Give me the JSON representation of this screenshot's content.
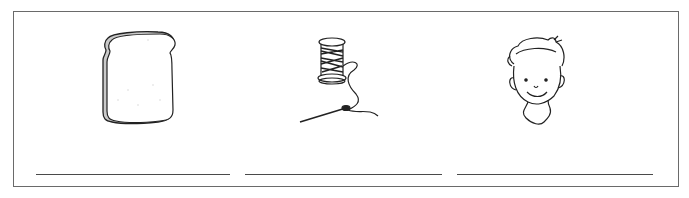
{
  "worksheet": {
    "items": [
      {
        "picture": "bread-slice",
        "answer": ""
      },
      {
        "picture": "thread-spool-and-needle",
        "answer": ""
      },
      {
        "picture": "boy-face",
        "answer": ""
      }
    ]
  },
  "colors": {
    "ink": "#222222",
    "frame": "#6a6a6a",
    "line": "#4a4a4a",
    "shade": "#b8b8b8"
  }
}
